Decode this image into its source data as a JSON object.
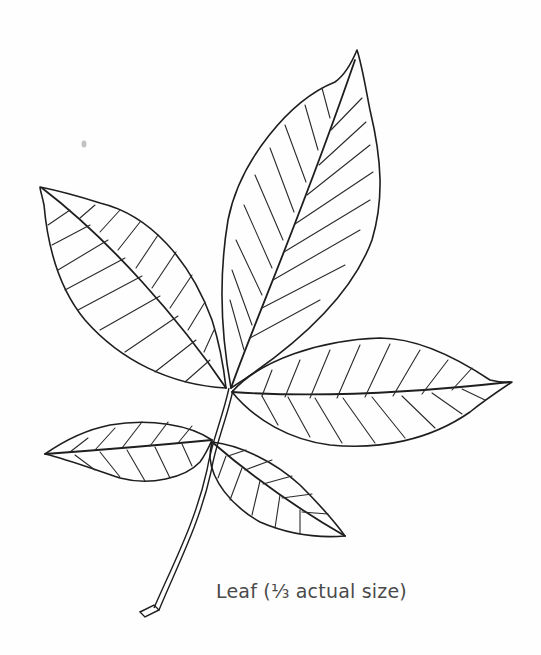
{
  "figure": {
    "caption": "Leaf (⅓ actual size)",
    "colors": {
      "background": "#fefefe",
      "ink": "#1e1e1e",
      "caption_text": "#4a4a4a"
    },
    "leaflets": [
      {
        "position": "top"
      },
      {
        "position": "upper-left"
      },
      {
        "position": "right"
      },
      {
        "position": "lower-left"
      },
      {
        "position": "lower-right"
      }
    ]
  }
}
